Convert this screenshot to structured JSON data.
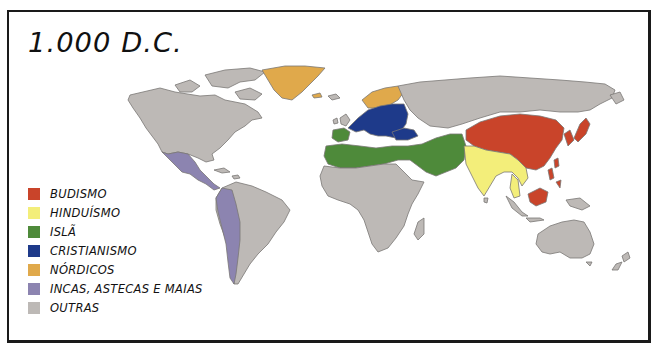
{
  "map": {
    "title": "1.000 D.C.",
    "colors": {
      "budismo": "#c9442a",
      "hinduismo": "#f3ee7a",
      "isla": "#4e8a3a",
      "cristianismo": "#1e3a8a",
      "nordicos": "#e0a94b",
      "incas": "#8c84b0",
      "outras": "#bdb9b6",
      "outline": "#7a7775"
    },
    "legend": [
      {
        "label": "BUDISMO",
        "color": "#c9442a"
      },
      {
        "label": "HINDUÍSMO",
        "color": "#f3ee7a"
      },
      {
        "label": "ISLÃ",
        "color": "#4e8a3a"
      },
      {
        "label": "CRISTIANISMO",
        "color": "#1e3a8a"
      },
      {
        "label": "NÓRDICOS",
        "color": "#e0a94b"
      },
      {
        "label": "INCAS, ASTECAS E MAIAS",
        "color": "#8c84b0"
      },
      {
        "label": "OUTRAS",
        "color": "#bdb9b6"
      }
    ]
  }
}
